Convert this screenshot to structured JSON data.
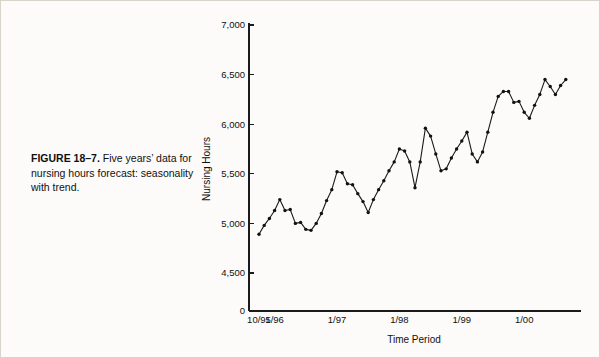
{
  "figure": {
    "number_label": "FIGURE 18–7.",
    "caption_text": "Five years’ data for nursing hours forecast: seasonality with trend."
  },
  "chart_data": {
    "type": "line",
    "title": "",
    "xlabel": "Time Period",
    "ylabel": "Nursing Hours",
    "ylim": [
      4300,
      7000
    ],
    "ytick_labels": [
      "0",
      "4,500",
      "5,000",
      "5,500",
      "6,000",
      "6,500",
      "7,000"
    ],
    "ytick_values": [
      0,
      4500,
      5000,
      5500,
      6000,
      6500,
      7000
    ],
    "axis_break": true,
    "grid": false,
    "legend": "none",
    "marker": "filled-circle",
    "xtick_labels": [
      "10/95",
      "1/96",
      "1/97",
      "1/98",
      "1/99",
      "1/00"
    ],
    "xtick_months": [
      0,
      3,
      15,
      27,
      39,
      51
    ],
    "x_start_label": "10/95",
    "x": [
      0,
      1,
      2,
      3,
      4,
      5,
      6,
      7,
      8,
      9,
      10,
      11,
      12,
      13,
      14,
      15,
      16,
      17,
      18,
      19,
      20,
      21,
      22,
      23,
      24,
      25,
      26,
      27,
      28,
      29,
      30,
      31,
      32,
      33,
      34,
      35,
      36,
      37,
      38,
      39,
      40,
      41,
      42,
      43,
      44,
      45,
      46,
      47,
      48,
      49,
      50,
      51,
      52,
      53,
      54,
      55,
      56,
      57,
      58,
      59
    ],
    "values": [
      4890,
      4980,
      5050,
      5130,
      5240,
      5130,
      5140,
      5000,
      5010,
      4940,
      4930,
      5000,
      5100,
      5230,
      5340,
      5520,
      5510,
      5400,
      5390,
      5300,
      5220,
      5110,
      5240,
      5340,
      5430,
      5530,
      5620,
      5750,
      5730,
      5620,
      5360,
      5620,
      5960,
      5880,
      5700,
      5530,
      5550,
      5660,
      5750,
      5830,
      5920,
      5700,
      5620,
      5720,
      5920,
      6120,
      6280,
      6330,
      6330,
      6220,
      6230,
      6120,
      6060,
      6190,
      6300,
      6450,
      6380,
      6300,
      6390,
      6450
    ]
  }
}
